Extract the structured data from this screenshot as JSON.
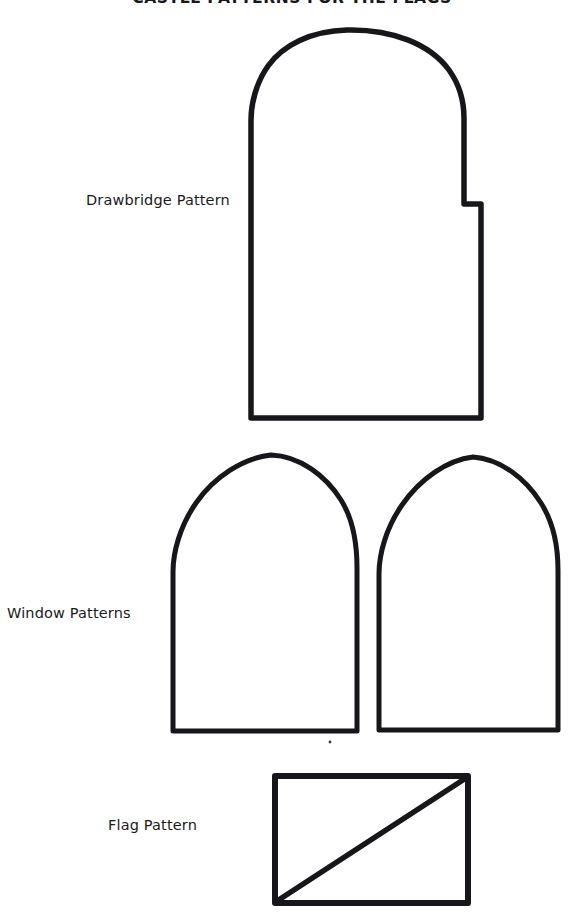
{
  "document": {
    "title": "CASTLE PATTERNS FOR THE FLAGS",
    "page_width": 584,
    "page_height": 920,
    "background_color": "#ffffff",
    "ink_color": "#17161a"
  },
  "labels": {
    "drawbridge": "Drawbridge Pattern",
    "windows": "Window Patterns",
    "flag": "Flag Pattern"
  },
  "patterns": [
    {
      "id": "drawbridge",
      "label": "Drawbridge Pattern",
      "shape": "arched-rectangle",
      "stroke_width": 5.5,
      "geometry": {
        "left": 250,
        "right": 483,
        "bottom": 418,
        "arch_top": 29,
        "arch_spring": 118,
        "corner_radius": 14
      }
    },
    {
      "id": "window-left",
      "label": "Window Pattern Left",
      "shape": "pointed-arch-rectangle",
      "stroke_width": 5,
      "geometry": {
        "left": 171,
        "right": 359,
        "bottom": 733,
        "arch_top": 453,
        "arch_spring": 568,
        "corner_radius": 12
      }
    },
    {
      "id": "window-right",
      "label": "Window Pattern Right",
      "shape": "pointed-arch-rectangle",
      "stroke_width": 5,
      "geometry": {
        "left": 377,
        "right": 563,
        "bottom": 732,
        "arch_top": 456,
        "arch_spring": 570,
        "corner_radius": 12
      }
    },
    {
      "id": "flag",
      "label": "Flag Pattern",
      "shape": "rectangle-with-diagonal",
      "stroke_width": 6,
      "geometry": {
        "left": 273,
        "right": 470,
        "top": 774,
        "bottom": 904,
        "diagonal_from": "bottom-left",
        "diagonal_to": "top-right"
      }
    }
  ]
}
